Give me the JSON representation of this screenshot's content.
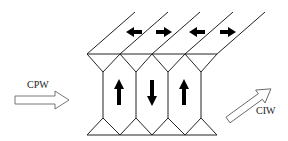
{
  "diagram": {
    "type": "heat-exchanger-flow-schematic",
    "labels": {
      "inlet": "CPW",
      "outlet": "CIW"
    },
    "channels_top": [
      {
        "index": 1,
        "direction": "left"
      },
      {
        "index": 2,
        "direction": "right"
      },
      {
        "index": 3,
        "direction": "left"
      },
      {
        "index": 4,
        "direction": "right"
      }
    ],
    "cells_vertical": [
      {
        "index": 1,
        "direction": "up"
      },
      {
        "index": 2,
        "direction": "down"
      },
      {
        "index": 3,
        "direction": "up"
      }
    ],
    "colors": {
      "line": "#222222",
      "arrow_fill": "#000000",
      "hollow_arrow_fill": "#ffffff"
    }
  }
}
